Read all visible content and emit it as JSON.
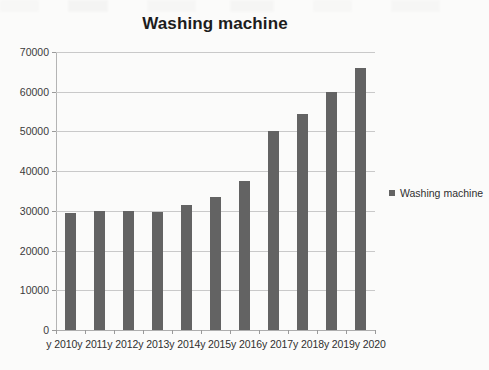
{
  "chart_data": {
    "type": "bar",
    "title": "Washing machine",
    "xlabel": "",
    "ylabel": "",
    "categories": [
      "y 2010",
      "y 2011",
      "y 2012",
      "y 2013",
      "y 2014",
      "y 2015",
      "y 2016",
      "y 2017",
      "y 2018",
      "y 2019",
      "y 2020"
    ],
    "values": [
      29500,
      30000,
      30000,
      29800,
      31500,
      33500,
      37500,
      50000,
      54500,
      60000,
      66000
    ],
    "series": [
      {
        "name": "Washing machine",
        "values": [
          29500,
          30000,
          30000,
          29800,
          31500,
          33500,
          37500,
          50000,
          54500,
          60000,
          66000
        ]
      }
    ],
    "ylim": [
      0,
      70000
    ],
    "ytick_labels": [
      "70000",
      "60000",
      "50000",
      "40000",
      "30000",
      "20000",
      "10000",
      "0"
    ],
    "ytick_values": [
      70000,
      60000,
      50000,
      40000,
      30000,
      20000,
      10000,
      0
    ],
    "grid": true,
    "legend": {
      "position": "right",
      "entries": [
        {
          "label": "Washing machine",
          "color": "#636363",
          "marker": "square-marker"
        }
      ]
    },
    "colors": {
      "bar": "#636363",
      "gridline": "#c9c9c9",
      "axis": "#b4b4b4",
      "text": "#2b2b2b",
      "background": "#fbfbfa"
    }
  }
}
